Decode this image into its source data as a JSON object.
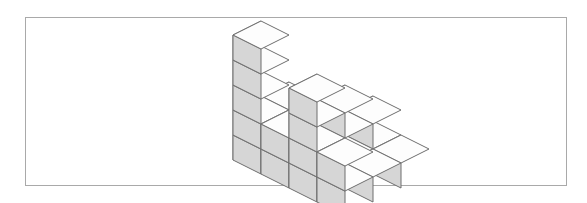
{
  "figure": {
    "caption": "",
    "frame": {
      "x": 25,
      "y": 17,
      "width": 542,
      "height": 169,
      "border_color": "#a9a9a9",
      "background_color": "#ffffff"
    }
  },
  "illustration": {
    "name": "isometric-cube-stack",
    "description": "Stack of unit cubes drawn in isometric projection",
    "projection": "isometric",
    "origin": {
      "x": 233,
      "y": 160
    },
    "cube": {
      "half_width": 28,
      "half_depth": 28,
      "depth_rise": 14,
      "height": 25
    },
    "colors": {
      "top_face": "#fdfdfd",
      "front_face": "#ffffff",
      "right_face": "#d6d6d6",
      "edge": "#6e6e6e"
    },
    "grid": {
      "cols": 4,
      "rows": 3,
      "col_label": "x",
      "row_label": "y"
    },
    "heightmap": [
      [
        5,
        2,
        4,
        2
      ],
      [
        2,
        1,
        3,
        1
      ],
      [
        1,
        1,
        2,
        1
      ]
    ],
    "total_cubes": 30
  }
}
